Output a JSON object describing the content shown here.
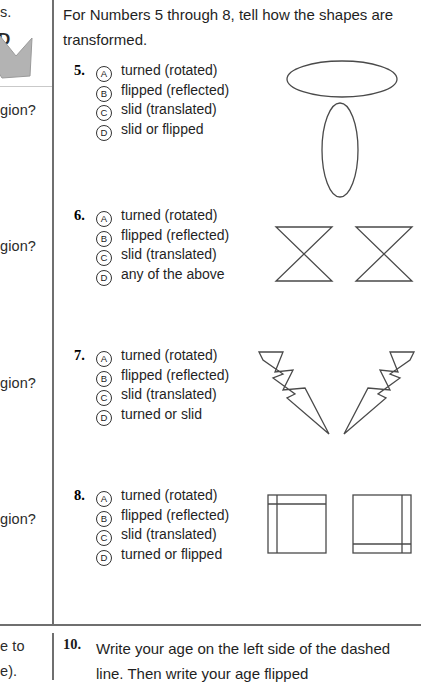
{
  "page": {
    "intro_text": "For Numbers 5 through 8, tell how the shapes are transformed."
  },
  "left_column": {
    "fragments": [
      {
        "text": "s.",
        "bold": false
      },
      {
        "text": "D",
        "bold": true
      },
      {
        "text": "gion?",
        "bold": false
      },
      {
        "text": "gion?",
        "bold": false
      },
      {
        "text": "gion?",
        "bold": false
      },
      {
        "text": "gion?",
        "bold": false
      },
      {
        "text": "e to",
        "bold": false
      },
      {
        "text": "e).",
        "bold": false
      }
    ],
    "shape_name": "gray-arrow-fragment"
  },
  "questions": [
    {
      "number": "5.",
      "choices": [
        {
          "letter": "A",
          "text": "turned (rotated)"
        },
        {
          "letter": "B",
          "text": "flipped (reflected)"
        },
        {
          "letter": "C",
          "text": "slid (translated)"
        },
        {
          "letter": "D",
          "text": "slid or flipped"
        }
      ],
      "figure": "two-ellipses-rotated"
    },
    {
      "number": "6.",
      "choices": [
        {
          "letter": "A",
          "text": "turned (rotated)"
        },
        {
          "letter": "B",
          "text": "flipped (reflected)"
        },
        {
          "letter": "C",
          "text": "slid (translated)"
        },
        {
          "letter": "D",
          "text": "any of the above"
        }
      ],
      "figure": "two-bowties-translated"
    },
    {
      "number": "7.",
      "choices": [
        {
          "letter": "A",
          "text": "turned (rotated)"
        },
        {
          "letter": "B",
          "text": "flipped (reflected)"
        },
        {
          "letter": "C",
          "text": "slid (translated)"
        },
        {
          "letter": "D",
          "text": "turned or slid"
        }
      ],
      "figure": "two-lightning-bolts-reflected"
    },
    {
      "number": "8.",
      "choices": [
        {
          "letter": "A",
          "text": "turned (rotated)"
        },
        {
          "letter": "B",
          "text": "flipped (reflected)"
        },
        {
          "letter": "C",
          "text": "slid (translated)"
        },
        {
          "letter": "D",
          "text": "turned or flipped"
        }
      ],
      "figure": "two-squares-rotated"
    }
  ],
  "question10": {
    "number": "10.",
    "text": "Write your age on the left side of the dashed line. Then write your age flipped"
  },
  "colors": {
    "ink": "#1f1f1f",
    "rule": "#6f6f6f",
    "shape_stroke": "#4a4a4a",
    "gray_fill": "#b0b0b0"
  }
}
